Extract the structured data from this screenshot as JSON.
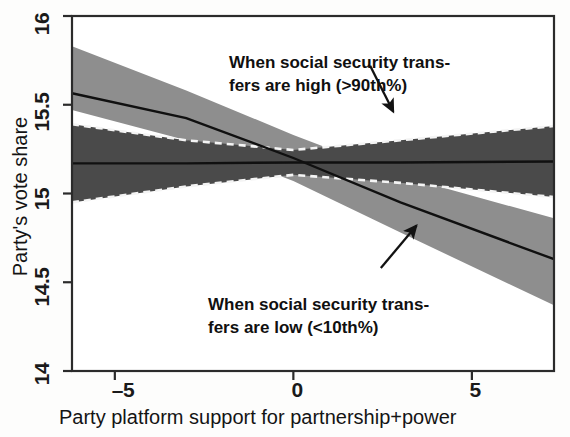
{
  "figure": {
    "background_color": "#fdfdfc",
    "frame_color": "#2b2b2b"
  },
  "chart_data": {
    "type": "line",
    "title": "",
    "subtitle": "",
    "xlabel": "Party platform support for partnership+power",
    "ylabel": "Party's vote share",
    "xlim": [
      -6.2,
      7.3
    ],
    "ylim": [
      14,
      16
    ],
    "xticks": [
      -5,
      0,
      5
    ],
    "xticklabels": [
      "–5",
      "0",
      "5"
    ],
    "yticks": [
      14,
      14.5,
      15,
      15.5,
      16
    ],
    "yticklabels": [
      "14",
      "14.5",
      "15",
      "15.5",
      "16"
    ],
    "grid": false,
    "legend": "annotations",
    "series": [
      {
        "name": "When social security transfers are low (<10th%)",
        "style": "solid line with shaded 95% confidence band",
        "band_color": "#8e8e8e",
        "line_color": "#121212",
        "x": [
          -6.2,
          -3,
          0,
          3,
          7.3
        ],
        "y": [
          15.565,
          15.425,
          15.2,
          14.95,
          14.63
        ],
        "y_lower": [
          15.47,
          15.3,
          15.07,
          14.78,
          14.37
        ],
        "y_upper": [
          15.83,
          15.58,
          15.33,
          15.1,
          14.86
        ]
      },
      {
        "name": "When social security transfers are high (>90th%)",
        "style": "solid line with dashed-edge shaded 95% confidence band",
        "band_color": "#4a4a4a",
        "band_edge_style": "dashed",
        "band_edge_color": "#f2f2f2",
        "line_color": "#101010",
        "x": [
          -6.2,
          -3,
          0,
          3,
          7.3
        ],
        "y": [
          15.17,
          15.17,
          15.175,
          15.175,
          15.18
        ],
        "y_lower": [
          14.95,
          15.04,
          15.105,
          15.06,
          14.98
        ],
        "y_upper": [
          15.39,
          15.3,
          15.245,
          15.3,
          15.38
        ]
      }
    ],
    "annotations": [
      {
        "id": "high-annotation",
        "lines": [
          "When social security trans-",
          "fers are high (>90th%)"
        ],
        "arrow_from": [
          2.15,
          15.72
        ],
        "arrow_to": [
          2.8,
          15.46
        ]
      },
      {
        "id": "low-annotation",
        "lines": [
          "When social security trans-",
          "fers are low (<10th%)"
        ],
        "arrow_from": [
          2.45,
          14.58
        ],
        "arrow_to": [
          3.45,
          14.82
        ]
      }
    ]
  },
  "axes": {
    "ytick_0": "14",
    "ytick_1": "14.5",
    "ytick_2": "15",
    "ytick_3": "15.5",
    "ytick_4": "16",
    "xtick_0": "–5",
    "xtick_1": "0",
    "xtick_2": "5",
    "x_axis_title": "Party platform support for partnership+power",
    "y_axis_title": "Party's vote share"
  },
  "annotations": {
    "high_line_1": "When social security trans-",
    "high_line_2": "fers are high (>90th%)",
    "low_line_1": "When social security trans-",
    "low_line_2": "fers are low (<10th%)"
  }
}
